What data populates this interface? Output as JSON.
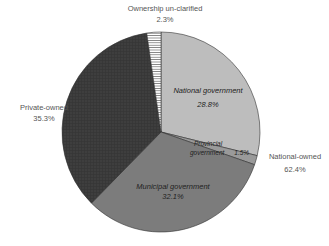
{
  "chart_data": {
    "type": "pie",
    "title": "",
    "start_angle_deg": 0,
    "direction": "clockwise",
    "slices": [
      {
        "label": "National government",
        "value": 28.8,
        "display": "28.8%",
        "color": "#bdbdbd",
        "group": "National-owned",
        "label_position": "inside"
      },
      {
        "label": "Provincial government",
        "value": 1.5,
        "display": "1.5%",
        "color": "#9a9a9a",
        "group": "National-owned",
        "label_position": "inside"
      },
      {
        "label": "Municipal government",
        "value": 32.1,
        "display": "32.1%",
        "color": "#7c7c7c",
        "group": "National-owned",
        "label_position": "inside"
      },
      {
        "label": "Private-owned",
        "value": 35.3,
        "display": "35.3%",
        "color": "#3c3c3c",
        "pattern": "crosshatch",
        "label_position": "outside"
      },
      {
        "label": "Ownership un-clarified",
        "value": 2.3,
        "display": "2.3%",
        "color": "#ffffff",
        "pattern": "horizontal-stripes",
        "label_position": "outside"
      }
    ],
    "group_labels": [
      {
        "label": "National-owned",
        "value": 62.4,
        "display": "62.4%"
      }
    ],
    "legend": "none"
  },
  "labels": {
    "unclarified_name": "Ownership un-clarified",
    "unclarified_pct": "2.3%",
    "private_name": "Private-owned",
    "private_pct": "35.3%",
    "national_owned_name": "National-owned",
    "national_owned_pct": "62.4%",
    "national_gov_name": "National government",
    "national_gov_pct": "28.8%",
    "provincial_name_line1": "Provincial",
    "provincial_name_line2": "government",
    "provincial_pct": "1.5%",
    "municipal_name": "Municipal government",
    "municipal_pct": "32.1%"
  }
}
